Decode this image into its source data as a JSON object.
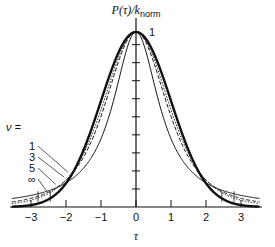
{
  "chart_data": {
    "type": "line",
    "title_main": "P(τ)/k",
    "title_sub": "norm",
    "xlabel": "τ",
    "ylabel": "P(τ)/k_norm",
    "xlim": [
      -3.6,
      3.6
    ],
    "x_ticks": [
      -3,
      -2,
      -1,
      0,
      1,
      2,
      3
    ],
    "x_tick_labels": [
      "−3",
      "−2",
      "−1",
      "0",
      "1",
      "2",
      "3"
    ],
    "y_tick_count": 9,
    "peak_label": "1",
    "legend_title": "ν =",
    "grid": false,
    "series": [
      {
        "name": "1",
        "style": "thin-solid",
        "description": "Student t, ν=1 (Cauchy-like, widest tails)"
      },
      {
        "name": "3",
        "style": "dashed",
        "description": "Student t, ν=3"
      },
      {
        "name": "5",
        "style": "dotted",
        "description": "Student t, ν=5"
      },
      {
        "name": "∞",
        "style": "thick-solid",
        "description": "Gaussian limit ν=∞"
      }
    ]
  },
  "labels": {
    "legend_title": "ν =",
    "nu_values": [
      "1",
      "3",
      "5",
      "∞"
    ],
    "peak": "1",
    "x_axis": "τ"
  }
}
